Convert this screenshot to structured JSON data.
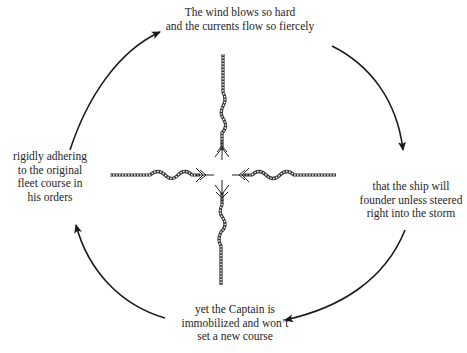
{
  "diagram": {
    "type": "cycle",
    "nodes": [
      {
        "id": "top",
        "lines": [
          "The wind blows so hard",
          "and the currents flow so fiercely"
        ]
      },
      {
        "id": "right",
        "lines": [
          "that the ship will",
          "founder unless steered",
          "right into the storm"
        ]
      },
      {
        "id": "bottom",
        "lines": [
          "yet the Captain is",
          "immobilized and won’t",
          "set a new course"
        ]
      },
      {
        "id": "left",
        "lines": [
          "rigidly adhering",
          "to the original",
          "fleet course in",
          "his orders"
        ]
      }
    ],
    "edges": [
      {
        "from": "left",
        "to": "top"
      },
      {
        "from": "top",
        "to": "right"
      },
      {
        "from": "right",
        "to": "bottom"
      },
      {
        "from": "bottom",
        "to": "left"
      }
    ],
    "center_graphic": "four-frayed-ropes-pulling-outward",
    "colors": {
      "line": "#1a1a1a",
      "background": "#ffffff"
    }
  }
}
